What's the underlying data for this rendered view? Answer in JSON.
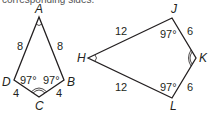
{
  "header": {
    "cropped_text": "corresponding sides."
  },
  "kite_left": {
    "vertices": {
      "A": {
        "label": "A",
        "x": 39,
        "y": 17
      },
      "B": {
        "label": "B",
        "x": 64,
        "y": 80
      },
      "C": {
        "label": "C",
        "x": 39,
        "y": 97
      },
      "D": {
        "label": "D",
        "x": 14,
        "y": 80
      }
    },
    "sides": {
      "AD": "8",
      "AB": "8",
      "DC": "4",
      "BC": "4"
    },
    "angles": {
      "D": "97°",
      "B": "97°"
    }
  },
  "kite_right": {
    "vertices": {
      "H": {
        "label": "H",
        "x": 88,
        "y": 58
      },
      "J": {
        "label": "J",
        "x": 172,
        "y": 18
      },
      "K": {
        "label": "K",
        "x": 196,
        "y": 58
      },
      "L": {
        "label": "L",
        "x": 172,
        "y": 98
      }
    },
    "sides": {
      "HJ": "12",
      "HL": "12",
      "JK": "6",
      "LK": "6"
    },
    "angles": {
      "J": "97°",
      "L": "97°"
    }
  },
  "colors": {
    "stroke": "#231f20",
    "background": "#ffffff"
  }
}
